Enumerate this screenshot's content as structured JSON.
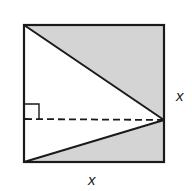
{
  "diagram": {
    "type": "geometry-figure",
    "colors": {
      "stroke": "#1a1a1a",
      "shade": "#d4d4d4",
      "background": "#ffffff"
    },
    "square": {
      "top_left": [
        24,
        25
      ],
      "top_right": [
        164,
        25
      ],
      "bottom_right": [
        164,
        162
      ],
      "bottom_left": [
        24,
        162
      ]
    },
    "apex_point": [
      164,
      120
    ],
    "right_angle_marker": {
      "corner": [
        24,
        119
      ],
      "size": 15
    },
    "labels": {
      "right_side": "x",
      "bottom_side": "x"
    },
    "regions": [
      {
        "name": "upper-shaded-triangle",
        "shaded": true
      },
      {
        "name": "lower-shaded-triangle",
        "shaded": true
      },
      {
        "name": "central-white-triangle",
        "shaded": false
      }
    ]
  }
}
